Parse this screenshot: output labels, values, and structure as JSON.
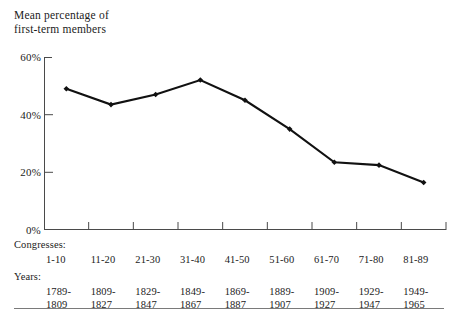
{
  "title": {
    "line1": "Mean percentage of",
    "line2": "first-term members"
  },
  "axes": {
    "y_ticks": [
      "60%",
      "40%",
      "20%",
      "0%"
    ],
    "congress_caption": "Congresses:",
    "years_caption": "Years:"
  },
  "chart_data": {
    "type": "line",
    "title": "Mean percentage of first-term members",
    "xlabel": "Congresses",
    "ylabel": "Mean percentage of first-term members",
    "ylim": [
      0,
      60
    ],
    "yticks": [
      0,
      20,
      40,
      60
    ],
    "ytick_labels": [
      "0%",
      "20%",
      "40%",
      "60%"
    ],
    "grid": false,
    "legend": "none",
    "marker": "filled-diamond",
    "line_color": "#111111",
    "categories": [
      "1-10",
      "11-20",
      "21-30",
      "31-40",
      "41-50",
      "51-60",
      "61-70",
      "71-80",
      "81-89"
    ],
    "year_ranges": [
      {
        "start": "1789-",
        "end": "1809"
      },
      {
        "start": "1809-",
        "end": "1827"
      },
      {
        "start": "1829-",
        "end": "1847"
      },
      {
        "start": "1849-",
        "end": "1867"
      },
      {
        "start": "1869-",
        "end": "1887"
      },
      {
        "start": "1889-",
        "end": "1907"
      },
      {
        "start": "1909-",
        "end": "1927"
      },
      {
        "start": "1929-",
        "end": "1947"
      },
      {
        "start": "1949-",
        "end": "1965"
      }
    ],
    "values": [
      49,
      43.5,
      47,
      52,
      45,
      35,
      23.5,
      22.5,
      16.5
    ]
  }
}
